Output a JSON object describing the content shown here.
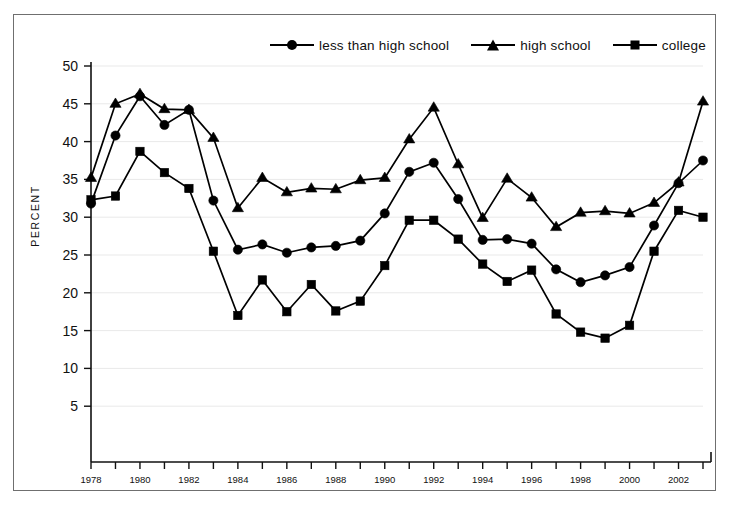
{
  "chart_data": {
    "type": "line",
    "title": "",
    "xlabel": "",
    "ylabel": "PERCENT",
    "ylim": [
      0,
      50
    ],
    "ytick_values": [
      5,
      10,
      15,
      20,
      25,
      30,
      35,
      40,
      45,
      50
    ],
    "ytick_labels": [
      "5",
      "10",
      "15",
      "20",
      "25",
      "30",
      "35",
      "40",
      "45",
      "50"
    ],
    "xlim": [
      1978,
      2003
    ],
    "x": [
      1978,
      1979,
      1980,
      1981,
      1982,
      1983,
      1984,
      1985,
      1986,
      1987,
      1988,
      1989,
      1990,
      1991,
      1992,
      1993,
      1994,
      1995,
      1996,
      1997,
      1998,
      1999,
      2000,
      2001,
      2002,
      2003
    ],
    "xtick_labels": [
      "1978",
      "",
      "1980",
      "",
      "1982",
      "",
      "1984",
      "",
      "1986",
      "",
      "1988",
      "",
      "1990",
      "",
      "1992",
      "",
      "1994",
      "",
      "1996",
      "",
      "1998",
      "",
      "2000",
      "",
      "2002",
      ""
    ],
    "grid": true,
    "grid_axis": "y",
    "legend_position": "top",
    "series": [
      {
        "name": "less than high school",
        "marker": "circle",
        "color": "#000000",
        "values": [
          31.8,
          40.8,
          46.0,
          42.2,
          44.2,
          32.2,
          25.7,
          26.4,
          25.3,
          26.0,
          26.2,
          26.9,
          30.5,
          36.0,
          37.2,
          32.4,
          27.0,
          27.1,
          26.5,
          23.1,
          21.4,
          22.3,
          23.4,
          28.9,
          34.5,
          37.5
        ]
      },
      {
        "name": "high school",
        "marker": "triangle",
        "color": "#000000",
        "values": [
          35.2,
          45.0,
          46.3,
          44.3,
          44.2,
          40.5,
          31.2,
          35.2,
          33.3,
          33.8,
          33.7,
          34.9,
          35.2,
          40.3,
          44.5,
          37.0,
          29.9,
          35.1,
          32.6,
          28.7,
          30.6,
          30.8,
          30.5,
          31.9,
          34.6,
          45.3
        ]
      },
      {
        "name": "college",
        "marker": "square",
        "color": "#000000",
        "values": [
          32.3,
          32.8,
          38.7,
          35.9,
          33.8,
          25.5,
          17.0,
          21.7,
          17.5,
          21.1,
          17.6,
          18.9,
          23.6,
          29.6,
          29.6,
          27.1,
          23.8,
          21.5,
          23.0,
          17.2,
          14.8,
          14.0,
          15.7,
          25.5,
          30.9,
          30.0
        ]
      }
    ]
  },
  "legend": {
    "items": [
      {
        "label": "less than high school",
        "marker": "circle"
      },
      {
        "label": "high school",
        "marker": "triangle"
      },
      {
        "label": "college",
        "marker": "square"
      }
    ]
  },
  "axis": {
    "y_title": "PERCENT"
  }
}
